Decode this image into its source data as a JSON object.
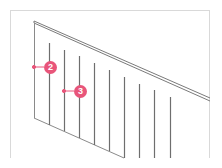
{
  "diagram": {
    "accent_color": "#e8557a",
    "line_color": "#6e6e6e",
    "callouts": [
      {
        "label": "2",
        "target": "panel left edge"
      },
      {
        "label": "3",
        "target": "baluster"
      }
    ],
    "baluster_count": 9
  }
}
